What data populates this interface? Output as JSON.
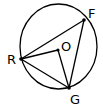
{
  "diagram": {
    "type": "circle-geometry",
    "circle": {
      "center": "O"
    },
    "points": [
      {
        "id": "R",
        "label": "R",
        "on_circle": true
      },
      {
        "id": "F",
        "label": "F",
        "on_circle": true
      },
      {
        "id": "G",
        "label": "G",
        "on_circle": true
      },
      {
        "id": "O",
        "label": "O",
        "on_circle": false
      }
    ],
    "segments": [
      {
        "from": "R",
        "to": "F"
      },
      {
        "from": "F",
        "to": "G"
      },
      {
        "from": "G",
        "to": "R"
      },
      {
        "from": "R",
        "to": "O"
      },
      {
        "from": "O",
        "to": "G"
      }
    ],
    "colors": {
      "line": "#000000",
      "background": "#ffffff"
    }
  }
}
